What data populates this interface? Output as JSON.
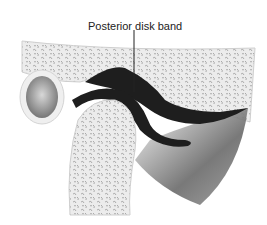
{
  "diagram": {
    "labels": [
      {
        "text": "Posterior disk band",
        "target": "posterior-disk-band"
      }
    ],
    "colors": {
      "bone_fill": "#e8e8e8",
      "bone_texture": "#9a9a9a",
      "disk": "#1e1e1e",
      "muscle": "#555555",
      "canal": "#8a8a8a"
    }
  }
}
